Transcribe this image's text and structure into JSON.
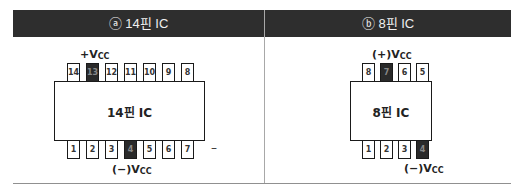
{
  "panels": [
    {
      "header": "ⓐ 14핀 IC",
      "ic_label": "14핀 IC",
      "top_pins": [
        "14",
        "13",
        "12",
        "11",
        "10",
        "9",
        "8"
      ],
      "bottom_pins": [
        "1",
        "2",
        "3",
        "4",
        "5",
        "6",
        "7"
      ],
      "highlight_top": "13",
      "highlight_bottom": "4",
      "vcc_plus_label": "+V",
      "vcc_plus_sub": "CC",
      "vcc_minus_label": "(−)V",
      "vcc_minus_sub": "CC",
      "dash": "–"
    },
    {
      "header": "ⓑ 8핀 IC",
      "ic_label": "8핀 IC",
      "top_pins": [
        "8",
        "7",
        "6",
        "5"
      ],
      "bottom_pins": [
        "1",
        "2",
        "3",
        "4"
      ],
      "highlight_top": "7",
      "highlight_bottom": "4",
      "vcc_plus_label": "(+)V",
      "vcc_plus_sub": "CC",
      "vcc_minus_label": "(−)V",
      "vcc_minus_sub": "CC"
    }
  ],
  "colors": {
    "header_bg": "#2e2e2e",
    "pin_dark": "#2a2a2a"
  }
}
